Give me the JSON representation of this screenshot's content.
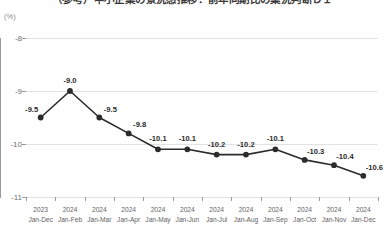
{
  "chart_data": {
    "type": "line",
    "title": "（参考）中小企業の景況感推移：前年同期比の業況判断ＤＩ",
    "ylabel": "(%)",
    "xlabel": "",
    "yunit_label": "(%)",
    "ylim": [
      -11,
      -8
    ],
    "ytick_labels": [
      "-8",
      "-9",
      "-10",
      "-11"
    ],
    "ytick_values": [
      -8,
      -9,
      -10,
      -11
    ],
    "grid": true,
    "legend": "none",
    "categories": [
      "2023 Jan-Dec",
      "2024 Jan-Feb",
      "2024 Jan-Mar",
      "2024 Jan-Apr",
      "2024 Jan-May",
      "2024 Jan-Jun",
      "2024 Jan-Jul",
      "2024 Jan-Aug",
      "2024 Jan-Sep",
      "2024 Jan-Oct",
      "2024 Jan-Nov",
      "2024 Jan-Dec"
    ],
    "category_years": [
      "2023",
      "2024",
      "2024",
      "2024",
      "2024",
      "2024",
      "2024",
      "2024",
      "2024",
      "2024",
      "2024",
      "2024"
    ],
    "category_months": [
      "Jan-Dec",
      "Jan-Feb",
      "Jan-Mar",
      "Jan-Apr",
      "Jan-May",
      "Jan-Jun",
      "Jan-Jul",
      "Jan-Aug",
      "Jan-Sep",
      "Jan-Oct",
      "Jan-Nov",
      "Jan-Dec"
    ],
    "values": [
      -9.5,
      -9.0,
      -9.5,
      -9.8,
      -10.1,
      -10.1,
      -10.2,
      -10.2,
      -10.1,
      -10.3,
      -10.4,
      -10.6
    ],
    "data_labels": [
      "-9.5",
      "-9.0",
      "-9.5",
      "-9.8",
      "-10.1",
      "-10.1",
      "-10.2",
      "-10.2",
      "-10.1",
      "-10.3",
      "-10.4",
      "-10.6"
    ],
    "label_positions": [
      "above-left",
      "above",
      "above-right",
      "above-right",
      "above",
      "above",
      "above",
      "above",
      "above",
      "above-right",
      "above-right",
      "above-right"
    ],
    "series_color": "#2b2b2b",
    "marker_color": "#2b2b2b",
    "grid_color": "#e2e2e2",
    "axis_color": "#9a9a9a"
  }
}
